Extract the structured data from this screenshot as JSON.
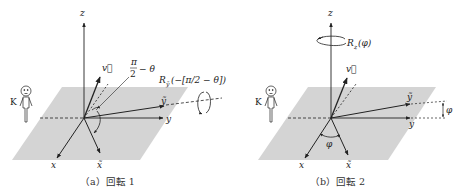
{
  "figure": {
    "panels": [
      {
        "id": "a",
        "caption": "（a）回転 1",
        "axes": {
          "z": "z",
          "x": "x",
          "y": "y",
          "x_tilde": "x̃",
          "y_tilde": "ỹ",
          "v": "v⃗"
        },
        "angle_label_num": "π",
        "angle_label_den": "2",
        "angle_label_rest": "− θ",
        "rotation_label": "R",
        "rotation_sub": "ỹ",
        "rotation_arg": "(−[π/2 − θ])",
        "observer": "K"
      },
      {
        "id": "b",
        "caption": "（b）回転 2",
        "axes": {
          "z": "z",
          "x": "x",
          "y": "y",
          "x_tilde": "x̃",
          "y_tilde": "ỹ",
          "v": "v⃗"
        },
        "angle_label": "φ",
        "angle_label_side": "φ",
        "rotation_label": "R",
        "rotation_sub": "z",
        "rotation_arg": "(φ)",
        "observer": "K"
      }
    ],
    "colors": {
      "plane": "#d4d4d4",
      "line": "#222222",
      "background": "#ffffff"
    }
  }
}
